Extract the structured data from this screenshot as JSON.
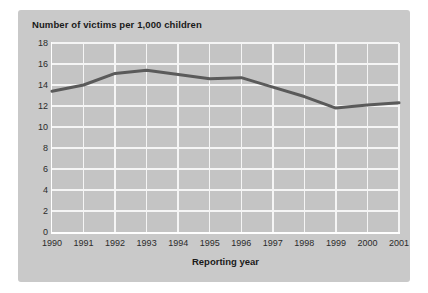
{
  "chart_data": {
    "type": "line",
    "title": "Number of victims per 1,000 children",
    "xlabel": "Reporting year",
    "ylabel": "",
    "categories": [
      "1990",
      "1991",
      "1992",
      "1993",
      "1994",
      "1995",
      "1996",
      "1997",
      "1998",
      "1999",
      "2000",
      "2001"
    ],
    "values": [
      13.4,
      14.0,
      15.1,
      15.4,
      15.0,
      14.6,
      14.7,
      13.8,
      12.9,
      11.8,
      12.1,
      12.3
    ],
    "series": [
      {
        "name": "Number of victims per 1,000 children",
        "values": [
          13.4,
          14.0,
          15.1,
          15.4,
          15.0,
          14.6,
          14.7,
          13.8,
          12.9,
          11.8,
          12.1,
          12.3
        ]
      }
    ],
    "ylim": [
      0,
      18
    ],
    "yticks": [
      0,
      2,
      4,
      6,
      8,
      10,
      12,
      14,
      16,
      18
    ],
    "ytick_labels": [
      "0",
      "2",
      "4",
      "6",
      "8",
      "10",
      "12",
      "14",
      "16",
      "18"
    ],
    "xtick_labels": [
      "1990",
      "1991",
      "1992",
      "1993",
      "1994",
      "1995",
      "1996",
      "1997",
      "1998",
      "1999",
      "2000",
      "2001"
    ],
    "grid": true,
    "legend": false,
    "legend_position": "none",
    "colors": {
      "line": "#5a5a5a",
      "panel_background": "#c9c9c9",
      "plot_background": "#c4c4c4",
      "gridline": "#f5f5f5",
      "axis": "#ffffff",
      "text": "#1a1a1a"
    },
    "line_width": 3
  }
}
